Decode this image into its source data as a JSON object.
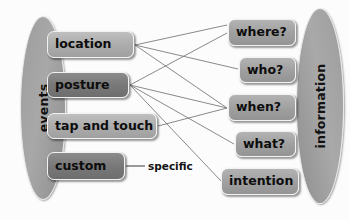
{
  "diagram": {
    "groups": [
      {
        "id": "events",
        "label": "events",
        "side": "left"
      },
      {
        "id": "information",
        "label": "information",
        "side": "right"
      }
    ],
    "left_nodes": [
      {
        "id": "location",
        "label": "location",
        "tone": "light"
      },
      {
        "id": "posture",
        "label": "posture",
        "tone": "dark"
      },
      {
        "id": "tap-and-touch",
        "label": "tap and touch",
        "tone": "light"
      },
      {
        "id": "custom",
        "label": "custom",
        "tone": "dark"
      }
    ],
    "right_nodes": [
      {
        "id": "where",
        "label": "where?",
        "tone": "mid"
      },
      {
        "id": "who",
        "label": "who?",
        "tone": "mid"
      },
      {
        "id": "when",
        "label": "when?",
        "tone": "mid"
      },
      {
        "id": "what",
        "label": "what?",
        "tone": "mid"
      },
      {
        "id": "intention",
        "label": "intention",
        "tone": "mid"
      }
    ],
    "annotations": [
      {
        "id": "specific",
        "label": "specific"
      }
    ],
    "edges": [
      {
        "from": "location",
        "to": "where"
      },
      {
        "from": "location",
        "to": "who"
      },
      {
        "from": "location",
        "to": "when"
      },
      {
        "from": "posture",
        "to": "where"
      },
      {
        "from": "posture",
        "to": "when"
      },
      {
        "from": "posture",
        "to": "what"
      },
      {
        "from": "posture",
        "to": "intention"
      },
      {
        "from": "tap-and-touch",
        "to": "when"
      },
      {
        "from": "custom",
        "to": "specific"
      }
    ],
    "colors": {
      "group_fill": "#a3a3a3",
      "node_light": "#b4b4b4",
      "node_dark": "#7a7a7a",
      "node_mid": "#a4a4a4",
      "edge": "#7c7c7c",
      "text": "#0d0d0d",
      "background": "#fcfcfc"
    }
  }
}
